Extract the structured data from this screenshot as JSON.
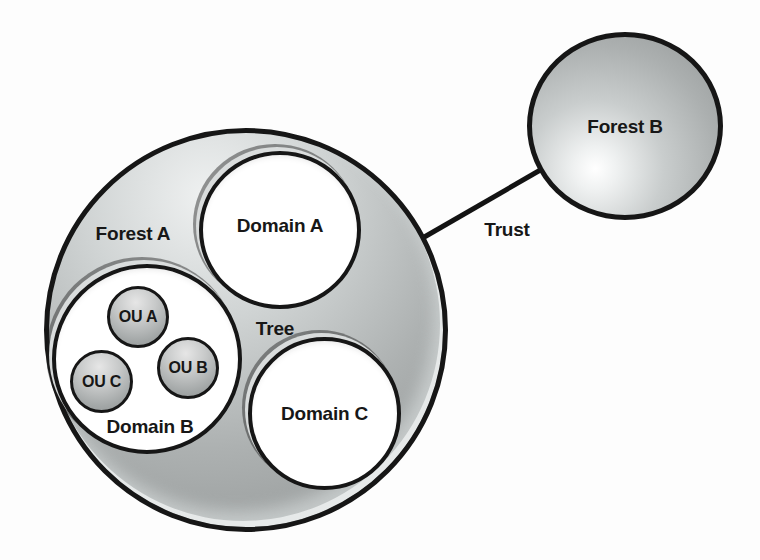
{
  "diagram": {
    "forest_a": {
      "label": "Forest A"
    },
    "forest_b": {
      "label": "Forest B"
    },
    "domain_a": {
      "label": "Domain A"
    },
    "domain_b": {
      "label": "Domain B"
    },
    "domain_c": {
      "label": "Domain C"
    },
    "ou_a": {
      "label": "OU A"
    },
    "ou_b": {
      "label": "OU B"
    },
    "ou_c": {
      "label": "OU C"
    },
    "tree_label": "Tree",
    "trust_label": "Trust",
    "colors": {
      "outline": "#161616",
      "text": "#171717",
      "forest_fill_light": "#eff1f1",
      "forest_fill_dark": "#959999",
      "domain_fill": "#ffffff",
      "ou_fill_light": "#e6e6e6",
      "ou_fill_dark": "#8f9393",
      "trust_line": "#131313",
      "background": "#fdfdfd"
    }
  }
}
